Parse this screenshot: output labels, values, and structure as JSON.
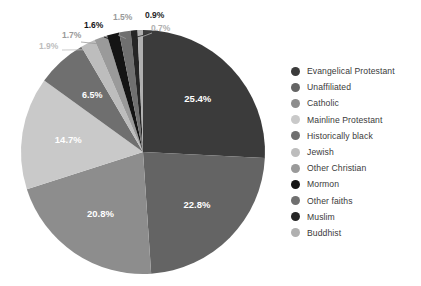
{
  "chart_data": {
    "type": "pie",
    "title": "",
    "subtitle": "",
    "xlabel": "",
    "ylabel": "",
    "legend_position": "right",
    "grid": false,
    "start_angle_deg": 0,
    "direction": "clockwise",
    "value_unit": "%",
    "categories": [
      "Evangelical Protestant",
      "Unaffiliated",
      "Catholic",
      "Mainline Protestant",
      "Historically black",
      "Jewish",
      "Other Christian",
      "Mormon",
      "Other faiths",
      "Muslim",
      "Buddhist"
    ],
    "values": [
      25.4,
      22.8,
      20.8,
      14.7,
      6.5,
      1.9,
      1.7,
      1.6,
      1.5,
      0.9,
      0.7
    ],
    "labels": [
      "25.4%",
      "22.8%",
      "20.8%",
      "14.7%",
      "6.5%",
      "1.9%",
      "1.7%",
      "1.6%",
      "1.5%",
      "0.9%",
      "0.7%"
    ],
    "colors": [
      "#3b3b3b",
      "#646464",
      "#8d8d8d",
      "#c9c9c9",
      "#6f6f6f",
      "#bdbdbd",
      "#9a9a9a",
      "#141414",
      "#707070",
      "#262626",
      "#b0b0b0"
    ],
    "label_colors": [
      "#ffffff",
      "#ffffff",
      "#ffffff",
      "#ffffff",
      "#ffffff",
      "#bdbdbd",
      "#9a9a9a",
      "#141414",
      "#9a9a9a",
      "#262626",
      "#b0b0b0"
    ],
    "label_placement": [
      "inside",
      "inside",
      "inside",
      "inside",
      "inside",
      "outside",
      "outside",
      "outside",
      "outside",
      "outside",
      "outside"
    ]
  },
  "legend": {
    "items": [
      {
        "label": "Evangelical Protestant",
        "color": "#3b3b3b"
      },
      {
        "label": "Unaffiliated",
        "color": "#646464"
      },
      {
        "label": "Catholic",
        "color": "#8d8d8d"
      },
      {
        "label": "Mainline Protestant",
        "color": "#c9c9c9"
      },
      {
        "label": "Historically black",
        "color": "#6f6f6f"
      },
      {
        "label": "Jewish",
        "color": "#bdbdbd"
      },
      {
        "label": "Other Christian",
        "color": "#9a9a9a"
      },
      {
        "label": "Mormon",
        "color": "#141414"
      },
      {
        "label": "Other faiths",
        "color": "#707070"
      },
      {
        "label": "Muslim",
        "color": "#262626"
      },
      {
        "label": "Buddhist",
        "color": "#b0b0b0"
      }
    ]
  }
}
